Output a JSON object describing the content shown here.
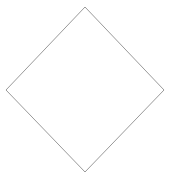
{
  "canvas": {
    "width": 174,
    "height": 182,
    "background_color": "#ffffff",
    "description": "diamond-outline"
  },
  "shape": {
    "name": "diamond",
    "kind": "rhombus-outline",
    "filled": false,
    "fill_color": "none",
    "stroke_color": "#9a9a9a",
    "stroke_width": 1,
    "vertices": [
      {
        "label": "top",
        "x": 85,
        "y": 7
      },
      {
        "label": "right",
        "x": 164,
        "y": 90
      },
      {
        "label": "bottom",
        "x": 85,
        "y": 172
      },
      {
        "label": "left",
        "x": 6,
        "y": 90
      }
    ],
    "points_attr": "85,7 164,90 85,172 6,90"
  }
}
